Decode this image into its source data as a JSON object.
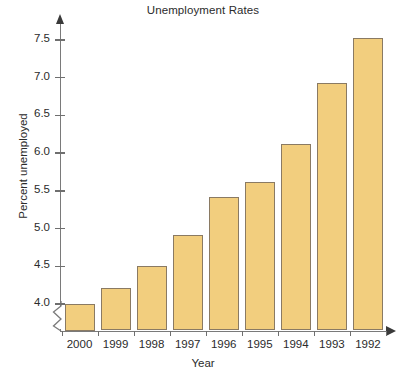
{
  "chart_data": {
    "type": "bar",
    "title": "Unemployment Rates",
    "xlabel": "Year",
    "ylabel": "Percent unemployed",
    "categories": [
      "2000",
      "1999",
      "1998",
      "1997",
      "1996",
      "1995",
      "1994",
      "1993",
      "1992"
    ],
    "values": [
      4.0,
      4.21,
      4.51,
      4.92,
      5.42,
      5.62,
      6.12,
      6.93,
      7.53
    ],
    "ytick_labels": [
      "4.0",
      "4.5",
      "5.0",
      "5.5",
      "6.0",
      "6.5",
      "7.0",
      "7.5"
    ],
    "ytick_values": [
      4.0,
      4.5,
      5.0,
      5.5,
      6.0,
      6.5,
      7.0,
      7.5
    ],
    "ylim": [
      3.78,
      7.72
    ],
    "axis_break": true,
    "axis_break_note": "zigzag break on y-axis below 4.0",
    "grid": false,
    "legend": null,
    "bar_fill_color": "#f2ce7e",
    "bar_border_color": "#8a7a63",
    "axis_color": "#7a7a7a",
    "text_color": "#2b2b2b",
    "y_axis_arrow": true,
    "x_axis_arrow": true
  }
}
